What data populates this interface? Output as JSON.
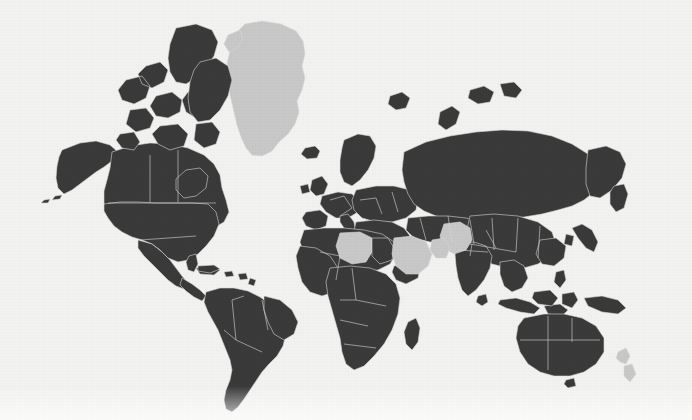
{
  "figure": {
    "kind": "world-choropleth-map",
    "width": 692,
    "height": 420,
    "projection": "equirectangular",
    "title": "",
    "background_color": "#f2f2f0"
  },
  "legend": {
    "visible": false,
    "entries": [
      {
        "label": "Data available",
        "color": "#3a3a3a",
        "swatch_name": "data-swatch"
      },
      {
        "label": "No data / highlighted",
        "color": "#c8c8c8",
        "swatch_name": "nodata-swatch"
      }
    ]
  },
  "style": {
    "land_data_color": "#3a3a3a",
    "land_highlight_color": "#c8c8c8",
    "border_color": "#d9d9d7",
    "ocean_color": "#f2f2f0",
    "border_width": "0.6"
  },
  "chart_data": {
    "type": "heatmap",
    "title": "",
    "xlabel": "",
    "ylabel": "",
    "legend_position": "none",
    "grid": false,
    "categories": [
      "Data available",
      "No data / highlighted"
    ],
    "values": [
      2,
      1
    ],
    "regions": [
      {
        "name": "North America",
        "state": "data",
        "color": "#3a3a3a"
      },
      {
        "name": "Canada",
        "state": "data",
        "color": "#3a3a3a"
      },
      {
        "name": "United States",
        "state": "data",
        "color": "#3a3a3a"
      },
      {
        "name": "Mexico",
        "state": "data",
        "color": "#3a3a3a"
      },
      {
        "name": "Greenland",
        "state": "highlight",
        "color": "#c8c8c8"
      },
      {
        "name": "Iceland",
        "state": "data",
        "color": "#3a3a3a"
      },
      {
        "name": "South America",
        "state": "data",
        "color": "#3a3a3a"
      },
      {
        "name": "Brazil",
        "state": "data",
        "color": "#3a3a3a"
      },
      {
        "name": "Argentina",
        "state": "data",
        "color": "#3a3a3a"
      },
      {
        "name": "Europe",
        "state": "data",
        "color": "#3a3a3a"
      },
      {
        "name": "Russia",
        "state": "data",
        "color": "#3a3a3a"
      },
      {
        "name": "China",
        "state": "data",
        "color": "#3a3a3a"
      },
      {
        "name": "India",
        "state": "data",
        "color": "#3a3a3a"
      },
      {
        "name": "Africa",
        "state": "data",
        "color": "#3a3a3a"
      },
      {
        "name": "Libya",
        "state": "highlight",
        "color": "#c8c8c8"
      },
      {
        "name": "Saudi Arabia",
        "state": "highlight",
        "color": "#c8c8c8"
      },
      {
        "name": "Afghanistan",
        "state": "highlight",
        "color": "#c8c8c8"
      },
      {
        "name": "Australia",
        "state": "data",
        "color": "#3a3a3a"
      },
      {
        "name": "Indonesia",
        "state": "data",
        "color": "#3a3a3a"
      },
      {
        "name": "New Zealand",
        "state": "highlight",
        "color": "#c8c8c8"
      },
      {
        "name": "Antarctica",
        "state": "not-drawn",
        "color": "#f2f2f0"
      }
    ]
  },
  "geometry": {
    "viewbox": "0 0 692 420",
    "shapes": [
      {
        "name": "greenland",
        "state": "highlight",
        "d": "M245,24 L262,21 L281,24 L296,31 L303,41 L305,54 L302,66 L305,78 L302,90 L297,101 L299,112 L295,124 L288,134 L279,142 L272,151 L262,156 L252,155 L246,148 L241,137 L237,125 L234,112 L231,99 L228,86 L229,74 L227,63 L230,51 L234,40 L239,30 Z"
      },
      {
        "name": "greenland-nw-lobe",
        "state": "highlight",
        "d": "M228,35 L240,30 L243,39 L237,48 L229,52 L224,44 Z"
      },
      {
        "name": "iceland",
        "state": "data",
        "d": "M305,148 L315,146 L320,151 L317,158 L307,159 L301,154 Z"
      },
      {
        "name": "alaska",
        "state": "data",
        "d": "M62,150 L80,143 L96,141 L110,145 L118,152 L112,161 L104,167 L96,172 L88,178 L80,184 L72,190 L64,194 L58,188 L56,178 L57,166 L59,157 Z"
      },
      {
        "name": "alaska-aleutians",
        "state": "data",
        "d": "M55,196 L62,195 L60,199 L52,200 Z M44,200 L50,199 L48,203 L41,203 Z"
      },
      {
        "name": "canada-mainland",
        "state": "data",
        "d": "M112,152 L130,146 L150,143 L170,144 L188,148 L204,155 L214,164 L220,175 L222,188 L226,200 L229,212 L224,222 L214,228 L200,230 L186,229 L172,226 L158,224 L144,223 L130,222 L118,220 L108,214 L104,203 L104,191 L107,180 L110,168 Z"
      },
      {
        "name": "canada-east-hudson",
        "state": "data",
        "d": "M186,170 L200,168 L208,176 L206,188 L196,196 L184,198 L176,190 L176,179 Z"
      },
      {
        "name": "canada-arctic-islands",
        "state": "data",
        "d": "M176,28 L196,24 L212,30 L218,42 L214,56 L206,68 L196,78 L186,84 L176,82 L170,72 L168,58 L170,44 Z M146,66 L160,62 L168,70 L164,82 L152,88 L142,84 L138,74 Z M126,80 L142,76 L150,86 L146,98 L134,104 L122,100 L118,90 Z M156,96 L172,92 L182,100 L180,112 L168,118 L156,116 L150,106 Z M188,92 L204,90 L212,100 L208,112 L196,118 L186,112 L182,100 Z M130,110 L146,108 L154,118 L150,128 L136,132 L126,124 Z M160,126 L178,124 L188,134 L184,146 L170,150 L158,144 L152,134 Z M196,124 L212,122 L220,132 L216,144 L204,148 L194,140 Z M120,134 L134,132 L140,142 L134,150 L122,148 L116,140 Z"
      },
      {
        "name": "baffin-island",
        "state": "data",
        "d": "M200,62 L216,58 L228,66 L232,80 L228,96 L220,110 L210,120 L198,122 L190,112 L188,98 L190,82 L194,70 Z"
      },
      {
        "name": "usa-mainland",
        "state": "data",
        "d": "M104,204 L120,202 L138,202 L156,203 L174,203 L192,203 L208,204 L216,212 L219,224 L214,236 L206,246 L198,254 L188,260 L178,262 L168,258 L160,250 L152,244 L142,240 L132,237 L122,232 L114,226 L108,218 L104,211 Z"
      },
      {
        "name": "usa-florida",
        "state": "data",
        "d": "M189,256 L196,254 L198,264 L194,272 L188,270 L186,262 Z"
      },
      {
        "name": "mexico",
        "state": "data",
        "d": "M138,240 L152,244 L162,252 L170,260 L176,268 L182,276 L188,283 L184,289 L176,286 L168,280 L160,272 L152,264 L144,256 L138,248 Z"
      },
      {
        "name": "central-america",
        "state": "data",
        "d": "M182,278 L192,284 L200,290 L206,296 L202,301 L194,297 L186,291 L180,285 Z"
      },
      {
        "name": "caribbean-islands",
        "state": "data",
        "d": "M196,268 L212,266 L220,270 L214,275 L200,274 Z M224,272 L232,271 L234,276 L226,277 Z M238,274 L246,273 L248,279 L240,280 Z M250,278 L256,280 L254,286 L248,284 Z"
      },
      {
        "name": "south-america",
        "state": "data",
        "d": "M206,292 L220,288 L234,288 L248,291 L260,297 L270,304 L278,312 L284,322 L286,334 L283,346 L277,356 L269,364 L262,372 L256,381 L250,390 L244,399 L238,407 L232,412 L226,409 L224,400 L226,390 L230,380 L232,370 L230,360 L226,350 L222,340 L218,330 L213,321 L208,312 L204,302 Z"
      },
      {
        "name": "brazil-bulge",
        "state": "data",
        "d": "M264,296 L280,300 L292,310 L298,322 L294,334 L284,340 L274,334 L268,322 L264,310 Z"
      },
      {
        "name": "europe-iberia",
        "state": "data",
        "d": "M306,212 L320,210 L328,216 L326,226 L316,230 L306,226 L302,218 Z"
      },
      {
        "name": "europe-france-germany",
        "state": "data",
        "d": "M322,196 L338,192 L352,194 L360,202 L358,212 L348,218 L336,218 L326,212 L320,204 Z"
      },
      {
        "name": "europe-italy",
        "state": "data",
        "d": "M340,216 L348,214 L354,222 L356,232 L350,236 L344,228 L340,222 Z"
      },
      {
        "name": "europe-british-isles",
        "state": "data",
        "d": "M312,180 L322,176 L328,184 L324,194 L316,196 L310,190 Z M300,186 L308,184 L310,192 L302,194 Z"
      },
      {
        "name": "scandinavia",
        "state": "data",
        "d": "M344,140 L358,134 L370,136 L376,146 L374,158 L368,170 L360,180 L352,186 L344,182 L340,172 L340,160 L342,148 Z"
      },
      {
        "name": "europe-east",
        "state": "data",
        "d": "M356,190 L376,186 L394,186 L410,190 L418,198 L416,210 L406,218 L392,222 L376,222 L362,218 L354,210 L352,200 Z"
      },
      {
        "name": "europe-balkans-turkey",
        "state": "data",
        "d": "M356,222 L374,220 L392,222 L404,228 L410,236 L404,242 L390,243 L374,241 L360,236 L354,230 Z"
      },
      {
        "name": "russia",
        "state": "data",
        "d": "M404,152 L426,142 L450,136 L476,132 L502,130 L528,131 L552,136 L572,144 L588,154 L598,166 L600,180 L594,192 L584,200 L572,206 L558,210 L542,214 L524,217 L506,219 L488,220 L470,220 L452,219 L436,216 L424,211 L414,204 L408,194 L404,182 L402,170 Z"
      },
      {
        "name": "russia-far-east",
        "state": "data",
        "d": "M588,150 L606,146 L620,152 L626,164 L622,178 L612,190 L600,198 L590,196 L586,184 L586,168 Z"
      },
      {
        "name": "kamchatka",
        "state": "data",
        "d": "M614,186 L624,184 L628,194 L624,208 L616,212 L610,204 L610,192 Z"
      },
      {
        "name": "central-asia",
        "state": "data",
        "d": "M408,218 L428,216 L448,216 L466,218 L480,222 L486,230 L480,238 L466,242 L448,243 L430,242 L414,238 L406,230 Z"
      },
      {
        "name": "china-mongolia",
        "state": "data",
        "d": "M470,216 L494,214 L518,216 L538,222 L552,232 L556,244 L550,256 L538,264 L524,268 L508,268 L492,264 L478,256 L470,246 L466,234 Z"
      },
      {
        "name": "china-east-coast",
        "state": "data",
        "d": "M540,240 L556,238 L566,246 L564,258 L554,266 L542,264 L536,254 Z"
      },
      {
        "name": "korea-japan",
        "state": "data",
        "d": "M572,228 L582,224 L592,230 L598,242 L594,252 L586,248 L578,238 Z M566,234 L574,236 L572,246 L564,244 Z"
      },
      {
        "name": "india",
        "state": "data",
        "d": "M458,244 L474,242 L486,246 L492,256 L490,268 L484,280 L476,290 L468,296 L462,290 L458,278 L456,266 L455,254 Z"
      },
      {
        "name": "southeast-asia",
        "state": "data",
        "d": "M500,262 L514,260 L524,266 L528,278 L522,288 L512,292 L504,286 L500,274 Z"
      },
      {
        "name": "indonesia-sumatra-java",
        "state": "data",
        "d": "M500,300 L516,298 L530,302 L540,308 L534,314 L520,312 L506,308 L498,304 Z M544,306 L560,304 L568,310 L562,316 L548,314 Z"
      },
      {
        "name": "borneo-sulawesi",
        "state": "data",
        "d": "M534,292 L550,290 L558,298 L552,306 L538,304 L532,298 Z M562,294 L574,292 L578,300 L572,308 L562,304 Z"
      },
      {
        "name": "philippines",
        "state": "data",
        "d": "M556,272 L564,270 L566,280 L560,288 L554,282 Z"
      },
      {
        "name": "new-guinea",
        "state": "data",
        "d": "M584,298 L602,296 L618,300 L626,308 L618,314 L602,312 L588,306 Z"
      },
      {
        "name": "australia",
        "state": "data",
        "d": "M524,318 L544,314 L564,314 L582,318 L596,326 L604,338 L604,352 L596,364 L584,372 L570,376 L554,376 L540,372 L528,364 L520,352 L516,338 L518,326 Z"
      },
      {
        "name": "tasmania",
        "state": "data",
        "d": "M566,380 L574,378 L576,386 L568,388 L564,384 Z"
      },
      {
        "name": "new-zealand",
        "state": "highlight",
        "d": "M618,352 L626,348 L630,356 L626,364 L620,362 L616,358 Z M624,366 L632,364 L636,374 L630,382 L624,376 Z"
      },
      {
        "name": "africa-north",
        "state": "data",
        "d": "M304,230 L324,228 L344,228 L364,230 L382,234 L394,242 L396,254 L390,264 L378,270 L362,272 L344,272 L326,270 L312,264 L304,254 L300,242 Z"
      },
      {
        "name": "libya-highlight",
        "state": "highlight",
        "d": "M340,233 L360,232 L372,238 L372,252 L366,262 L352,264 L340,258 L336,246 Z"
      },
      {
        "name": "egypt",
        "state": "data",
        "d": "M372,238 L388,238 L394,248 L392,260 L380,264 L372,256 Z"
      },
      {
        "name": "africa-west",
        "state": "data",
        "d": "M300,246 L316,248 L330,256 L338,268 L340,282 L334,292 L322,296 L310,292 L302,282 L298,268 L296,256 Z"
      },
      {
        "name": "africa-central-south",
        "state": "data",
        "d": "M330,268 L350,266 L370,268 L386,274 L396,284 L400,298 L398,314 L392,330 L384,344 L374,356 L364,366 L354,370 L346,364 L342,352 L340,338 L336,324 L332,310 L328,296 L326,282 Z"
      },
      {
        "name": "horn-of-africa",
        "state": "data",
        "d": "M394,266 L410,262 L420,268 L418,278 L406,284 L396,280 L392,272 Z"
      },
      {
        "name": "madagascar",
        "state": "data",
        "d": "M408,322 L416,318 L420,328 L418,342 L412,350 L406,344 L404,332 Z"
      },
      {
        "name": "arabia-highlight",
        "state": "highlight",
        "d": "M394,238 L412,236 L426,242 L432,254 L428,266 L418,274 L406,274 L396,266 L392,254 Z"
      },
      {
        "name": "afghanistan-highlight",
        "state": "highlight",
        "d": "M444,224 L460,222 L470,228 L472,240 L466,250 L454,254 L444,248 L440,236 Z"
      },
      {
        "name": "afghanistan-sw-lobe",
        "state": "highlight",
        "d": "M432,240 L444,238 L450,248 L446,258 L436,258 L430,250 Z"
      },
      {
        "name": "svalbard",
        "state": "data",
        "d": "M390,96 L402,92 L410,98 L406,108 L396,110 L388,104 Z"
      },
      {
        "name": "novaya-zemlya",
        "state": "data",
        "d": "M440,112 L452,106 L460,112 L456,124 L446,130 L438,124 Z"
      },
      {
        "name": "britain-misc-islands",
        "state": "data",
        "d": "M470,90 L484,86 L494,92 L490,102 L478,104 L468,98 Z M500,84 L514,82 L522,90 L516,98 L504,96 Z"
      },
      {
        "name": "sri-lanka",
        "state": "data",
        "d": "M478,296 L486,294 L488,302 L482,306 L476,302 Z"
      },
      {
        "name": "cuba-extra",
        "state": "data",
        "d": "M198,266 L214,265 L220,269 L210,273 L198,271 Z"
      }
    ],
    "internal_borders": [
      {
        "name": "usa-canada-49th-parallel",
        "d": "M108,203 L216,203"
      },
      {
        "name": "usa-mexico-border",
        "d": "M140,240 L196,236"
      },
      {
        "name": "canada-provinces",
        "d": "M150,155 L150,202 M178,150 L178,202"
      },
      {
        "name": "south-america-internal",
        "d": "M232,300 L236,340 M236,340 L262,352 M244,296 L232,300 M262,300 L268,330 M224,330 L236,340"
      },
      {
        "name": "africa-internal",
        "d": "M320,252 L340,256 M340,256 L336,280 M352,268 L356,300 M356,300 L386,306 M340,300 L356,300 M340,320 L368,326 M344,344 L376,348"
      },
      {
        "name": "europe-internal",
        "d": "M330,200 L344,196 M344,196 L352,208 M352,208 L340,216 M360,200 L376,198 M376,198 L382,214 M392,192 L398,212"
      },
      {
        "name": "asia-internal",
        "d": "M420,218 L426,240 M448,216 L452,242 M470,220 L474,244 M492,218 L494,250 M518,218 L516,252 M540,226 L538,258 M470,244 L516,252 M486,230 L496,248"
      },
      {
        "name": "india-internal",
        "d": "M458,250 L488,252 M472,244 L470,256"
      },
      {
        "name": "australia-internal",
        "d": "M548,316 L548,370 M520,340 L600,340 M572,318 L572,342"
      }
    ]
  }
}
